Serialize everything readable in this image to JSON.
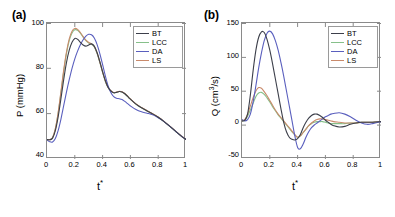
{
  "figure": {
    "panels": [
      {
        "tag": "(a)",
        "ylabel": "P (mmHg)",
        "xlabel": "t*",
        "xlabel_base": "t",
        "xlabel_sup": "*"
      },
      {
        "tag": "(b)",
        "ylabel_base": "Q (cm",
        "ylabel_sup": "3",
        "ylabel_tail": "/s)",
        "ylabel": "Q (cm3/s)",
        "xlabel": "t*",
        "xlabel_base": "t",
        "xlabel_sup": "*"
      }
    ],
    "legend_labels": [
      "BT",
      "LCC",
      "DA",
      "LS"
    ],
    "colors": {
      "BT": "#3c3f4a",
      "LCC": "#86c08a",
      "DA": "#5a5fbe",
      "LS": "#c98a6b"
    }
  },
  "chart_data": [
    {
      "type": "line",
      "title": "(a)",
      "xlabel": "t*",
      "ylabel": "P (mmHg)",
      "xlim": [
        0,
        1
      ],
      "ylim": [
        40,
        100
      ],
      "xticks": [
        0,
        0.2,
        0.4,
        0.6,
        0.8,
        1
      ],
      "xticklabels": [
        "0",
        "0.2",
        "0.4",
        "0.6",
        "0.8",
        "1"
      ],
      "yticks": [
        40,
        60,
        80,
        100
      ],
      "yticklabels": [
        "40",
        "60",
        "80",
        "100"
      ],
      "grid": false,
      "legend_position": "upper right",
      "x": [
        0,
        0.02,
        0.04,
        0.06,
        0.08,
        0.1,
        0.12,
        0.14,
        0.16,
        0.18,
        0.2,
        0.22,
        0.24,
        0.26,
        0.28,
        0.3,
        0.32,
        0.34,
        0.36,
        0.38,
        0.4,
        0.42,
        0.44,
        0.46,
        0.48,
        0.5,
        0.52,
        0.54,
        0.56,
        0.58,
        0.6,
        0.64,
        0.68,
        0.72,
        0.76,
        0.8,
        0.84,
        0.88,
        0.92,
        0.96,
        1.0
      ],
      "series": [
        {
          "name": "BT",
          "values": [
            48.6,
            48.5,
            49.2,
            52.5,
            58.5,
            66.5,
            75.0,
            82.5,
            88.0,
            91.5,
            93.2,
            92.8,
            91.5,
            90.3,
            89.8,
            90.3,
            90.8,
            89.8,
            87.0,
            83.0,
            78.5,
            74.5,
            71.5,
            70.0,
            69.2,
            69.4,
            69.8,
            69.6,
            68.8,
            67.6,
            66.4,
            64.2,
            62.6,
            61.2,
            59.9,
            58.4,
            56.6,
            54.6,
            52.5,
            50.4,
            48.6
          ]
        },
        {
          "name": "LCC",
          "values": [
            48.6,
            48.5,
            49.4,
            53.2,
            60.0,
            69.0,
            78.5,
            86.5,
            92.2,
            95.6,
            97.0,
            96.8,
            95.5,
            93.8,
            92.2,
            91.2,
            90.6,
            89.4,
            86.6,
            82.6,
            78.2,
            74.2,
            71.4,
            70.0,
            69.2,
            69.4,
            69.8,
            69.6,
            68.8,
            67.6,
            66.4,
            64.2,
            62.6,
            61.2,
            59.9,
            58.4,
            56.6,
            54.6,
            52.5,
            50.4,
            48.6
          ]
        },
        {
          "name": "DA",
          "values": [
            48.4,
            47.6,
            47.5,
            49.0,
            52.5,
            57.5,
            63.5,
            69.5,
            75.0,
            80.0,
            84.2,
            87.6,
            90.4,
            92.6,
            94.2,
            95.0,
            94.8,
            93.4,
            90.6,
            86.5,
            81.6,
            76.6,
            72.2,
            69.2,
            67.5,
            66.8,
            66.6,
            66.2,
            65.4,
            64.4,
            63.4,
            61.8,
            60.8,
            60.2,
            59.5,
            58.2,
            56.6,
            54.6,
            52.5,
            50.4,
            48.6
          ]
        },
        {
          "name": "LS",
          "values": [
            48.6,
            48.5,
            49.5,
            53.4,
            60.4,
            69.6,
            79.2,
            87.2,
            93.0,
            96.4,
            97.6,
            97.2,
            95.8,
            94.0,
            92.4,
            91.4,
            90.8,
            89.6,
            86.8,
            82.8,
            78.4,
            74.4,
            71.5,
            70.1,
            69.3,
            69.5,
            69.9,
            69.7,
            68.9,
            67.7,
            66.5,
            64.3,
            62.7,
            61.3,
            60.0,
            58.5,
            56.7,
            54.7,
            52.6,
            50.5,
            48.7
          ]
        }
      ]
    },
    {
      "type": "line",
      "title": "(b)",
      "xlabel": "t*",
      "ylabel": "Q (cm3/s)",
      "xlim": [
        0,
        1
      ],
      "ylim": [
        -50,
        150
      ],
      "xticks": [
        0,
        0.2,
        0.4,
        0.6,
        0.8,
        1
      ],
      "xticklabels": [
        "0",
        "0.2",
        "0.4",
        "0.6",
        "0.8",
        "1"
      ],
      "yticks": [
        -50,
        0,
        50,
        100,
        150
      ],
      "yticklabels": [
        "-50",
        "0",
        "50",
        "100",
        "150"
      ],
      "grid": false,
      "legend_position": "upper right",
      "x": [
        0,
        0.02,
        0.04,
        0.06,
        0.08,
        0.1,
        0.12,
        0.14,
        0.16,
        0.18,
        0.2,
        0.22,
        0.24,
        0.26,
        0.28,
        0.3,
        0.32,
        0.34,
        0.36,
        0.38,
        0.4,
        0.42,
        0.44,
        0.46,
        0.48,
        0.5,
        0.52,
        0.54,
        0.56,
        0.58,
        0.6,
        0.62,
        0.64,
        0.66,
        0.7,
        0.74,
        0.78,
        0.82,
        0.86,
        0.9,
        0.94,
        1.0
      ],
      "series": [
        {
          "name": "BT",
          "values": [
            6,
            7,
            16,
            44,
            80,
            110,
            129,
            137,
            136,
            126,
            110,
            90,
            68,
            46,
            24,
            4,
            -10,
            -18,
            -21,
            -22,
            -20,
            -14,
            -4,
            4,
            10,
            14,
            16,
            16,
            14,
            11,
            7,
            4,
            1,
            -1,
            -3,
            -2,
            1,
            3,
            4,
            4,
            4,
            5
          ]
        },
        {
          "name": "LCC",
          "values": [
            6,
            7,
            13,
            22,
            32,
            42,
            47,
            48,
            45,
            40,
            34,
            27,
            21,
            15,
            10,
            5,
            0,
            -5,
            -10,
            -15,
            -18,
            -16,
            -11,
            -6,
            -1,
            2,
            4,
            5,
            5,
            5,
            4,
            3,
            2,
            2,
            2,
            2,
            3,
            3,
            4,
            4,
            4,
            5
          ]
        },
        {
          "name": "DA",
          "values": [
            8,
            6,
            8,
            16,
            34,
            58,
            84,
            106,
            124,
            135,
            138,
            134,
            124,
            110,
            92,
            72,
            50,
            28,
            6,
            -16,
            -33,
            -35,
            -28,
            -18,
            -10,
            -4,
            0,
            3,
            6,
            9,
            12,
            14,
            16,
            17,
            18,
            16,
            12,
            7,
            3,
            1,
            2,
            5
          ]
        },
        {
          "name": "LS",
          "values": [
            6,
            8,
            16,
            28,
            40,
            50,
            55,
            54,
            49,
            43,
            36,
            29,
            22,
            16,
            11,
            6,
            1,
            -4,
            -9,
            -14,
            -18,
            -16,
            -11,
            -6,
            -1,
            3,
            6,
            8,
            9,
            9,
            8,
            7,
            6,
            5,
            4,
            3,
            3,
            3,
            4,
            4,
            4,
            5
          ]
        }
      ]
    }
  ]
}
